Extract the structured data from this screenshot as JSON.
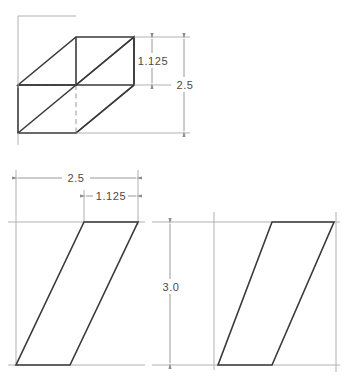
{
  "drawing": {
    "title": "Parallelepiped multiview engineering drawing",
    "background_color": "#ffffff",
    "line_color": "#3a3a3a",
    "thin_line_color": "#8d8d8d",
    "hidden_line_color": "#9a9a9a",
    "text_color": "#4a4a4a",
    "views": [
      {
        "name": "isometric-view",
        "label": "Isometric pictorial view",
        "type": "pictorial"
      },
      {
        "name": "front-view",
        "label": "Front view parallelogram",
        "type": "orthographic"
      },
      {
        "name": "side-view",
        "label": "Side view parallelogram",
        "type": "orthographic"
      }
    ],
    "dimensions": [
      {
        "id": "iso-height-upper",
        "value": "1.125",
        "orientation": "vertical",
        "view": "isometric-view"
      },
      {
        "id": "iso-height-overall",
        "value": "2.5",
        "orientation": "vertical",
        "view": "isometric-view"
      },
      {
        "id": "front-width-overall",
        "value": "2.5",
        "orientation": "horizontal",
        "view": "front-view"
      },
      {
        "id": "front-offset",
        "value": "1.125",
        "orientation": "horizontal",
        "view": "front-view"
      },
      {
        "id": "side-height",
        "value": "3.0",
        "orientation": "vertical",
        "view": "side-view"
      }
    ]
  }
}
